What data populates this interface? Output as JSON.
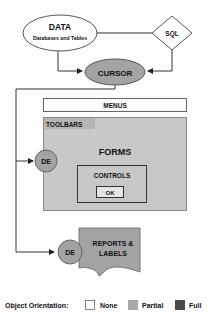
{
  "nodes": {
    "data": {
      "title": "DATA",
      "subtitle": "Databases and Tables"
    },
    "sql": {
      "label": "SQL"
    },
    "cursor": {
      "label": "CURSOR"
    },
    "menus": {
      "label": "MENUS"
    },
    "toolbars": {
      "label": "TOOLBARS"
    },
    "forms": {
      "label": "FORMS"
    },
    "forms_de": {
      "label": "DE"
    },
    "controls": {
      "label": "CONTROLS"
    },
    "ok": {
      "label": "OK"
    },
    "reports": {
      "line1": "REPORTS &",
      "line2": "LABELS"
    },
    "reports_de": {
      "label": "DE"
    }
  },
  "legend": {
    "title": "Object Orientation:",
    "items": [
      {
        "label": "None",
        "color": "#ffffff"
      },
      {
        "label": "Partial",
        "color": "#a9a9a9"
      },
      {
        "label": "Full",
        "color": "#4a4a4a"
      }
    ]
  },
  "colors": {
    "partial_fill": "#a9a9a9",
    "form_fill": "#c8c8c8",
    "line": "#333333"
  }
}
